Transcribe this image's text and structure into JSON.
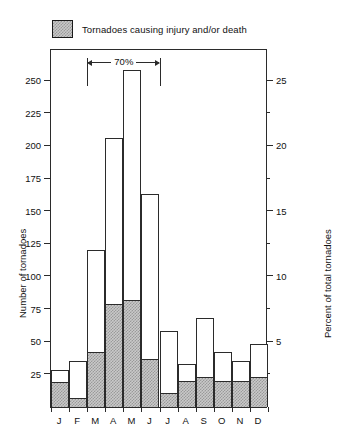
{
  "legend": {
    "swatch_name": "hatched-swatch",
    "label": "Tornadoes causing injury and/or death",
    "swatch_color": "#c9c9c9",
    "border_color": "#2b2b2b"
  },
  "annotation": {
    "label": "70%",
    "span_start_category": "M",
    "span_end_category": "J"
  },
  "chart_data": {
    "type": "bar",
    "title": "",
    "subtitle": "",
    "xlabel": "",
    "ylabel": "Number of tornadoes",
    "y2label": "Percent of total tornadoes",
    "categories": [
      "J",
      "F",
      "M",
      "A",
      "M",
      "J",
      "J",
      "A",
      "S",
      "O",
      "N",
      "D"
    ],
    "category_names": [
      "January",
      "February",
      "March",
      "April",
      "May",
      "June",
      "July",
      "August",
      "September",
      "October",
      "November",
      "December"
    ],
    "series": [
      {
        "name": "Total tornadoes",
        "fill": "white",
        "values": [
          28,
          35,
          120,
          206,
          258,
          163,
          58,
          33,
          68,
          42,
          35,
          48
        ]
      },
      {
        "name": "Tornadoes causing injury and/or death",
        "fill": "hatched",
        "values": [
          19,
          7,
          42,
          79,
          82,
          37,
          11,
          20,
          23,
          20,
          20,
          23
        ]
      }
    ],
    "ylim": [
      0,
      275
    ],
    "yticks": [
      25,
      50,
      75,
      100,
      125,
      150,
      175,
      200,
      225,
      250
    ],
    "yticklabels": [
      "25",
      "50",
      "75",
      "100",
      "125",
      "150",
      "175",
      "200",
      "225",
      "250"
    ],
    "y2lim": [
      0,
      27.5
    ],
    "y2ticks": [
      5,
      10,
      15,
      20,
      25
    ],
    "y2ticklabels": [
      "5",
      "10",
      "15",
      "20",
      "25"
    ],
    "y2minorticks": [
      2.5,
      7.5,
      12.5,
      17.5,
      22.5
    ],
    "grid": false,
    "legend_position": "above-top-left",
    "annotations": [
      {
        "text": "70%",
        "type": "span-bracket",
        "from": "M",
        "to": "J"
      }
    ]
  }
}
